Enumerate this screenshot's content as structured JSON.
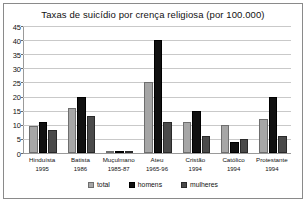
{
  "chart_data": {
    "type": "bar",
    "title": "Taxas de suicídio por crença religiosa (por 100.000)",
    "xlabel": "",
    "ylabel": "",
    "ylim": [
      0,
      45
    ],
    "ytick_step": 5,
    "yticks": [
      "0",
      "5",
      "10",
      "15",
      "20",
      "25",
      "30",
      "35",
      "40",
      "45"
    ],
    "grid": true,
    "legend_position": "bottom",
    "categories": [
      "Hinduísta",
      "Batista",
      "Muçulmano",
      "Ateu",
      "Cristão",
      "Católico",
      "Protestante"
    ],
    "category_years": [
      "1995",
      "1986",
      "1985-87",
      "1965-96",
      "1994",
      "1994",
      "1994"
    ],
    "series": [
      {
        "name": "total",
        "color": "#a6a6a6",
        "values": [
          9.5,
          16,
          0.3,
          25,
          11,
          10,
          12
        ]
      },
      {
        "name": "homens",
        "color": "#111111",
        "values": [
          11,
          20,
          0.3,
          40,
          15,
          4,
          20
        ]
      },
      {
        "name": "mulheres",
        "color": "#4a4a4a",
        "values": [
          8,
          13,
          0.2,
          11,
          6,
          5,
          6
        ]
      }
    ]
  }
}
